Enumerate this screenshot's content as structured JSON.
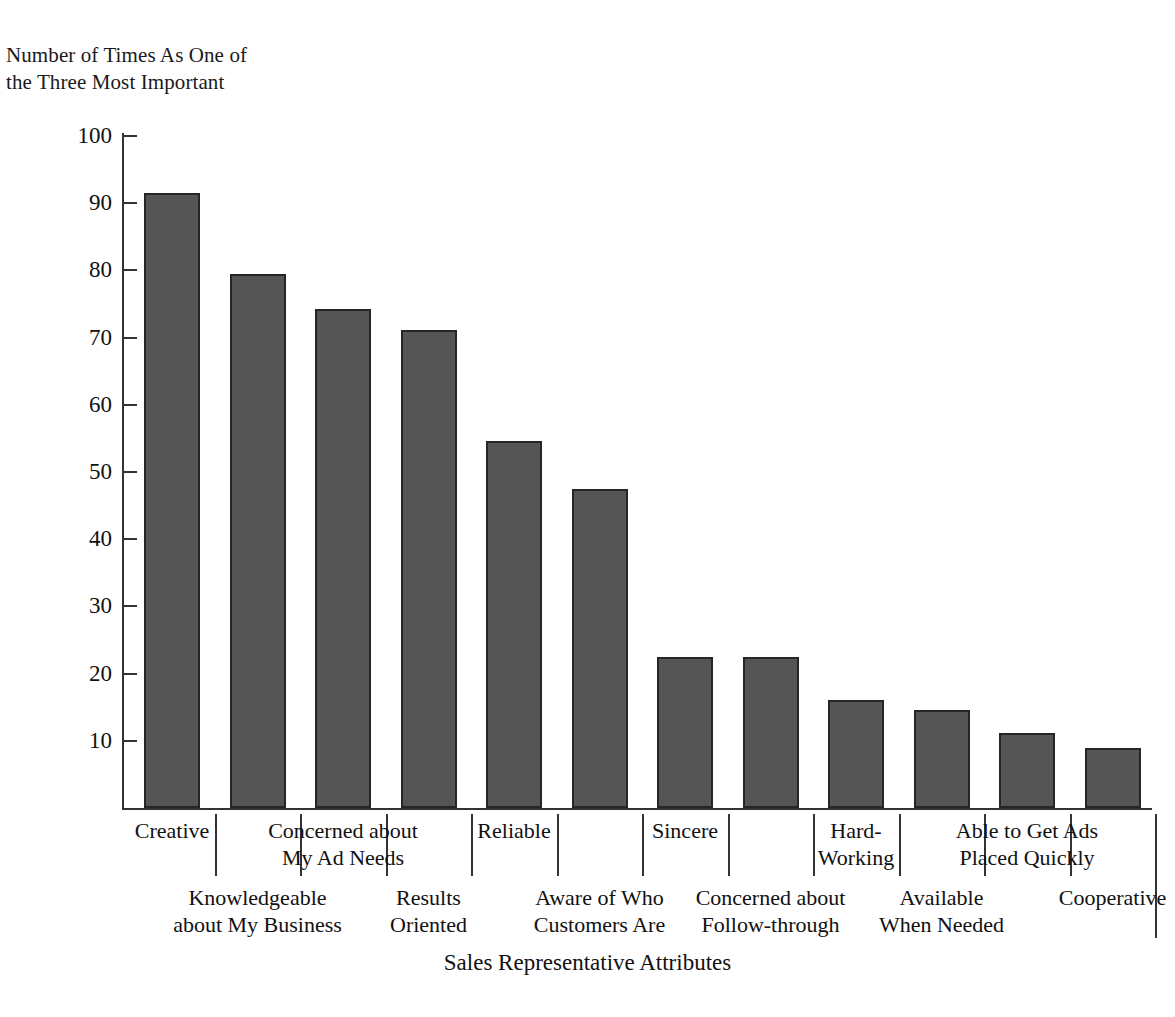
{
  "chart_data": {
    "type": "bar",
    "title": "",
    "ylabel": "Number of Times As One of\nthe Three Most Important",
    "xlabel": "Sales Representative Attributes",
    "ylim": [
      0,
      100
    ],
    "yticks": [
      10,
      20,
      30,
      40,
      50,
      60,
      70,
      80,
      90,
      100
    ],
    "grid": false,
    "legend": "none",
    "bar_color": "#555555",
    "bar_edge_color": "#262626",
    "categories": [
      "Creative",
      "Knowledgeable\nabout My Business",
      "Concerned about\nMy Ad Needs",
      "Results\nOriented",
      "Reliable",
      "Aware of Who\nCustomers Are",
      "Sincere",
      "Concerned about\nFollow-through",
      "Hard-\nWorking",
      "Available\nWhen Needed",
      "Able to Get Ads\nPlaced Quickly",
      "Cooperative"
    ],
    "values": [
      91.5,
      79.5,
      74.2,
      71.1,
      54.6,
      47.5,
      22.4,
      22.4,
      16.0,
      14.6,
      11.1,
      8.9
    ]
  },
  "axis": {
    "y_caption": "Number of Times As One of\nthe Three Most Important",
    "x_title": "Sales Representative Attributes",
    "tick_labels": [
      "100",
      "90",
      "80",
      "70",
      "60",
      "50",
      "40",
      "30",
      "20",
      "10"
    ]
  },
  "category_labels": {
    "upper_row": [
      "Creative",
      "Concerned about\nMy Ad Needs",
      "Reliable",
      "Sincere",
      "Hard-\nWorking",
      "Able to Get Ads\nPlaced Quickly"
    ],
    "lower_row": [
      "Knowledgeable\nabout My Business",
      "Results\nOriented",
      "Aware of Who\nCustomers Are",
      "Concerned about\nFollow-through",
      "Available\nWhen Needed",
      "Cooperative"
    ]
  }
}
